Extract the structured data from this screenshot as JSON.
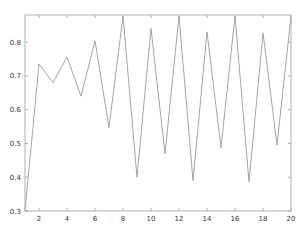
{
  "chart_data": {
    "type": "line",
    "title": "",
    "xlabel": "",
    "ylabel": "",
    "x": [
      1,
      2,
      3,
      4,
      5,
      6,
      7,
      8,
      9,
      10,
      11,
      12,
      13,
      14,
      15,
      16,
      17,
      18,
      19,
      20
    ],
    "series": [
      {
        "name": "series1",
        "values": [
          0.3,
          0.735,
          0.68,
          0.756,
          0.64,
          0.803,
          0.547,
          0.877,
          0.4,
          0.84,
          0.47,
          0.877,
          0.39,
          0.83,
          0.487,
          0.877,
          0.386,
          0.827,
          0.495,
          0.877
        ]
      }
    ],
    "xlim": [
      1,
      20
    ],
    "ylim": [
      0.3,
      0.88
    ],
    "xticks": [
      2,
      4,
      6,
      8,
      10,
      12,
      14,
      16,
      18,
      20
    ],
    "yticks": [
      0.3,
      0.4,
      0.5,
      0.6,
      0.7,
      0.8
    ],
    "ytick_labels": [
      "0.3",
      "0.4",
      "0.5",
      "0.6",
      "0.7",
      "0.8"
    ],
    "grid": false,
    "legend": null,
    "line_color": "#9a9a9a",
    "axis_color": "#b0b0b0"
  }
}
